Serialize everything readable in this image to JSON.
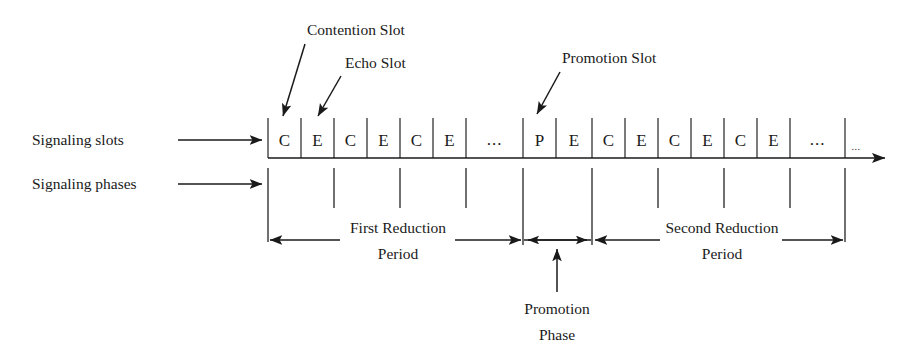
{
  "figure": {
    "background": "#ffffff",
    "ink": "#1a1a1a"
  },
  "side_labels": {
    "slots": "Signaling slots",
    "phases": "Signaling phases"
  },
  "callouts": {
    "contention": "Contention Slot",
    "echo": "Echo Slot",
    "promotion": "Promotion Slot"
  },
  "timeline": {
    "slots": [
      {
        "label": "C",
        "kind": "contention"
      },
      {
        "label": "E",
        "kind": "echo"
      },
      {
        "label": "C",
        "kind": "contention"
      },
      {
        "label": "E",
        "kind": "echo"
      },
      {
        "label": "C",
        "kind": "contention"
      },
      {
        "label": "E",
        "kind": "echo"
      },
      {
        "label": "...",
        "kind": "ellipsis"
      },
      {
        "label": "P",
        "kind": "promotion"
      },
      {
        "label": "E",
        "kind": "echo"
      },
      {
        "label": "C",
        "kind": "contention"
      },
      {
        "label": "E",
        "kind": "echo"
      },
      {
        "label": "C",
        "kind": "contention"
      },
      {
        "label": "E",
        "kind": "echo"
      },
      {
        "label": "C",
        "kind": "contention"
      },
      {
        "label": "E",
        "kind": "echo"
      },
      {
        "label": "...",
        "kind": "ellipsis"
      }
    ],
    "trailing_ellipsis": "...",
    "slot_labels": {
      "s0": "C",
      "s1": "E",
      "s2": "C",
      "s3": "E",
      "s4": "C",
      "s5": "E",
      "s6": "...",
      "s7": "P",
      "s8": "E",
      "s9": "C",
      "s10": "E",
      "s11": "C",
      "s12": "E",
      "s13": "C",
      "s14": "E",
      "s15": "..."
    }
  },
  "periods": {
    "first": {
      "line1": "First Reduction",
      "line2": "Period"
    },
    "promotion_phase": {
      "line1": "Promotion",
      "line2": "Phase"
    },
    "second": {
      "line1": "Second Reduction",
      "line2": "Period"
    }
  }
}
